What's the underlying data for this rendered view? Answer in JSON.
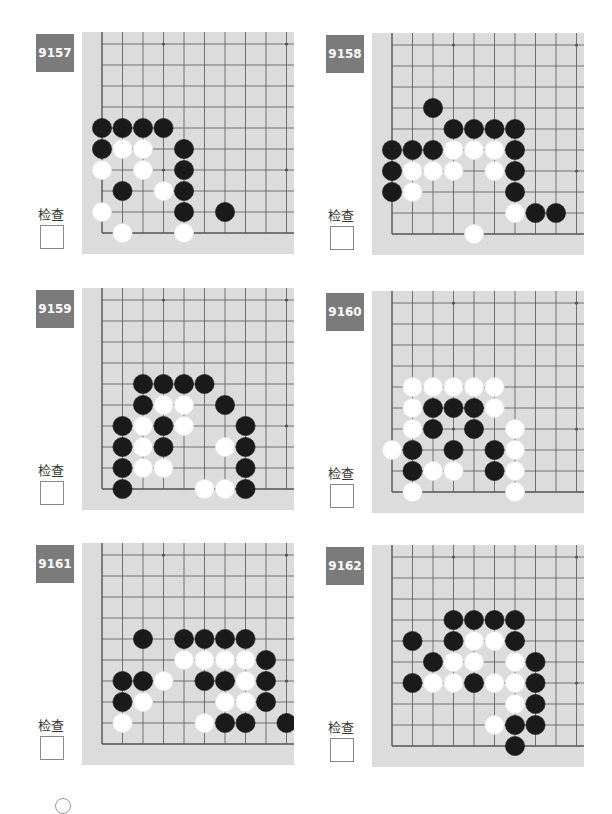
{
  "page": {
    "check_label": "检查",
    "colors": {
      "board": "#dcdcdc",
      "grid": "#555555",
      "label_bg": "#7b7b7b",
      "black": "#1a1a1a",
      "white": "#ffffff"
    }
  },
  "problems": [
    {
      "number": "9157",
      "stones": {
        "black": [
          [
            0,
            4
          ],
          [
            1,
            4
          ],
          [
            2,
            4
          ],
          [
            3,
            4
          ],
          [
            0,
            5
          ],
          [
            4,
            5
          ],
          [
            4,
            6
          ],
          [
            1,
            7
          ],
          [
            4,
            7
          ],
          [
            4,
            8
          ],
          [
            6,
            8
          ]
        ],
        "white": [
          [
            1,
            5
          ],
          [
            2,
            5
          ],
          [
            0,
            6
          ],
          [
            2,
            6
          ],
          [
            3,
            7
          ],
          [
            0,
            8
          ],
          [
            1,
            9
          ],
          [
            4,
            9
          ]
        ]
      }
    },
    {
      "number": "9158",
      "stones": {
        "black": [
          [
            2,
            3
          ],
          [
            3,
            4
          ],
          [
            4,
            4
          ],
          [
            5,
            4
          ],
          [
            6,
            4
          ],
          [
            0,
            5
          ],
          [
            1,
            5
          ],
          [
            2,
            5
          ],
          [
            6,
            5
          ],
          [
            0,
            6
          ],
          [
            6,
            6
          ],
          [
            0,
            7
          ],
          [
            6,
            7
          ],
          [
            7,
            8
          ],
          [
            8,
            8
          ]
        ],
        "white": [
          [
            3,
            5
          ],
          [
            4,
            5
          ],
          [
            5,
            5
          ],
          [
            1,
            6
          ],
          [
            2,
            6
          ],
          [
            3,
            6
          ],
          [
            5,
            6
          ],
          [
            1,
            7
          ],
          [
            6,
            8
          ],
          [
            4,
            9
          ]
        ]
      }
    },
    {
      "number": "9159",
      "stones": {
        "black": [
          [
            2,
            4
          ],
          [
            3,
            4
          ],
          [
            4,
            4
          ],
          [
            5,
            4
          ],
          [
            2,
            5
          ],
          [
            6,
            5
          ],
          [
            1,
            6
          ],
          [
            3,
            6
          ],
          [
            7,
            6
          ],
          [
            1,
            7
          ],
          [
            3,
            7
          ],
          [
            7,
            7
          ],
          [
            1,
            8
          ],
          [
            7,
            8
          ],
          [
            1,
            9
          ],
          [
            7,
            9
          ]
        ],
        "white": [
          [
            3,
            5
          ],
          [
            4,
            5
          ],
          [
            2,
            6
          ],
          [
            4,
            6
          ],
          [
            2,
            7
          ],
          [
            6,
            7
          ],
          [
            2,
            8
          ],
          [
            3,
            8
          ],
          [
            5,
            9
          ],
          [
            6,
            9
          ]
        ]
      }
    },
    {
      "number": "9160",
      "stones": {
        "black": [
          [
            2,
            5
          ],
          [
            3,
            5
          ],
          [
            4,
            5
          ],
          [
            2,
            6
          ],
          [
            4,
            6
          ],
          [
            1,
            7
          ],
          [
            3,
            7
          ],
          [
            5,
            7
          ],
          [
            1,
            8
          ],
          [
            5,
            8
          ]
        ],
        "white": [
          [
            1,
            4
          ],
          [
            2,
            4
          ],
          [
            3,
            4
          ],
          [
            4,
            4
          ],
          [
            5,
            4
          ],
          [
            1,
            5
          ],
          [
            5,
            5
          ],
          [
            1,
            6
          ],
          [
            6,
            6
          ],
          [
            0,
            7
          ],
          [
            6,
            7
          ],
          [
            2,
            8
          ],
          [
            3,
            8
          ],
          [
            6,
            8
          ],
          [
            1,
            9
          ],
          [
            6,
            9
          ]
        ]
      }
    },
    {
      "number": "9161",
      "stones": {
        "black": [
          [
            2,
            4
          ],
          [
            4,
            4
          ],
          [
            5,
            4
          ],
          [
            6,
            4
          ],
          [
            7,
            4
          ],
          [
            8,
            5
          ],
          [
            1,
            6
          ],
          [
            2,
            6
          ],
          [
            5,
            6
          ],
          [
            6,
            6
          ],
          [
            8,
            6
          ],
          [
            1,
            7
          ],
          [
            8,
            7
          ],
          [
            6,
            8
          ],
          [
            7,
            8
          ],
          [
            9,
            8
          ]
        ],
        "white": [
          [
            4,
            5
          ],
          [
            5,
            5
          ],
          [
            6,
            5
          ],
          [
            7,
            5
          ],
          [
            3,
            6
          ],
          [
            7,
            6
          ],
          [
            2,
            7
          ],
          [
            6,
            7
          ],
          [
            7,
            7
          ],
          [
            1,
            8
          ],
          [
            5,
            8
          ]
        ]
      }
    },
    {
      "number": "9162",
      "stones": {
        "black": [
          [
            3,
            3
          ],
          [
            4,
            3
          ],
          [
            5,
            3
          ],
          [
            6,
            3
          ],
          [
            1,
            4
          ],
          [
            3,
            4
          ],
          [
            6,
            4
          ],
          [
            2,
            5
          ],
          [
            7,
            5
          ],
          [
            1,
            6
          ],
          [
            4,
            6
          ],
          [
            7,
            6
          ],
          [
            7,
            7
          ],
          [
            6,
            8
          ],
          [
            7,
            8
          ],
          [
            6,
            9
          ]
        ],
        "white": [
          [
            4,
            4
          ],
          [
            5,
            4
          ],
          [
            3,
            5
          ],
          [
            4,
            5
          ],
          [
            6,
            5
          ],
          [
            2,
            6
          ],
          [
            3,
            6
          ],
          [
            5,
            6
          ],
          [
            6,
            6
          ],
          [
            6,
            7
          ],
          [
            5,
            8
          ]
        ]
      }
    }
  ]
}
